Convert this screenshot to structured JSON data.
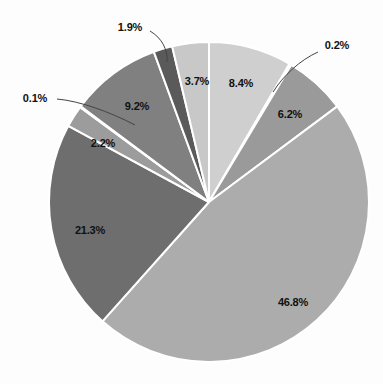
{
  "chart_data": {
    "type": "pie",
    "title": "",
    "xlabel": "",
    "ylabel": "",
    "grid": false,
    "legend": "none",
    "units": "percent",
    "start_angle_deg": 0,
    "direction": "clockwise",
    "center": {
      "x": 209,
      "y": 202
    },
    "radius": 160,
    "background_color": "#fdfdfd",
    "separator_color": "#ffffff",
    "label_color": "#111111",
    "categories": [
      "Slice 1",
      "Slice 2",
      "Slice 3",
      "Slice 4",
      "Slice 5",
      "Slice 6",
      "Slice 7",
      "Slice 8",
      "Slice 9",
      "Slice 10"
    ],
    "values": [
      8.4,
      0.2,
      6.2,
      46.8,
      21.3,
      2.2,
      0.1,
      9.2,
      1.9,
      3.7
    ],
    "labels": [
      "8.4%",
      "0.2%",
      "6.2%",
      "46.8%",
      "21.3%",
      "2.2%",
      "0.1%",
      "9.2%",
      "1.9%",
      "3.7%"
    ],
    "colors": [
      "#cfcfcf",
      "#bdbdbd",
      "#9a9a9a",
      "#acacac",
      "#6e6e6e",
      "#9c9c9c",
      "#c0c0c0",
      "#808080",
      "#5a5a5a",
      "#c8c8c8"
    ],
    "slices": [
      {
        "label": "8.4%",
        "value": 8.4,
        "color": "#cfcfcf",
        "label_x": 241,
        "label_y": 83,
        "leader": false
      },
      {
        "label": "0.2%",
        "value": 0.2,
        "color": "#bdbdbd",
        "label_x": 337,
        "label_y": 45,
        "leader": true,
        "leader_path": "M 318 52 C 300 60 283 76 273 92"
      },
      {
        "label": "6.2%",
        "value": 6.2,
        "color": "#9a9a9a",
        "label_x": 290,
        "label_y": 114,
        "leader": false
      },
      {
        "label": "46.8%",
        "value": 46.8,
        "color": "#acacac",
        "label_x": 293,
        "label_y": 302,
        "leader": false
      },
      {
        "label": "21.3%",
        "value": 21.3,
        "color": "#6e6e6e",
        "label_x": 90,
        "label_y": 230,
        "leader": false
      },
      {
        "label": "2.2%",
        "value": 2.2,
        "color": "#9c9c9c",
        "label_x": 103,
        "label_y": 143,
        "leader": false
      },
      {
        "label": "0.1%",
        "value": 0.1,
        "color": "#c0c0c0",
        "label_x": 35,
        "label_y": 98,
        "leader": true,
        "leader_path": "M 57 99 C 80 101 110 112 135 125"
      },
      {
        "label": "9.2%",
        "value": 9.2,
        "color": "#808080",
        "label_x": 137,
        "label_y": 106,
        "leader": false
      },
      {
        "label": "1.9%",
        "value": 1.9,
        "color": "#5a5a5a",
        "label_x": 130,
        "label_y": 27,
        "leader": true,
        "leader_path": "M 150 31 C 162 38 168 50 167 62"
      },
      {
        "label": "3.7%",
        "value": 3.7,
        "color": "#c8c8c8",
        "label_x": 197,
        "label_y": 81,
        "leader": false
      }
    ]
  }
}
